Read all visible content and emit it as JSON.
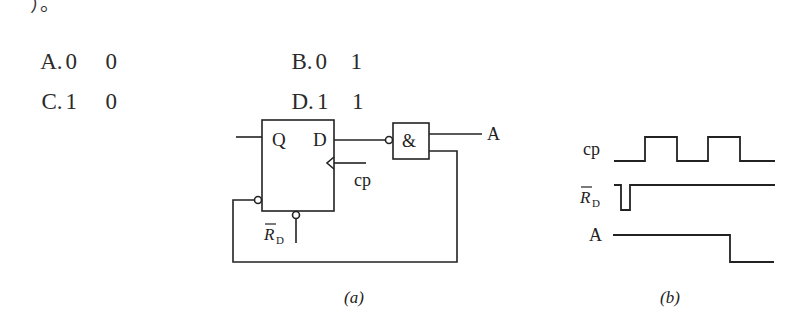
{
  "question_fragment": "）。",
  "options": [
    {
      "letter": "A.",
      "v1": "0",
      "v2": "0"
    },
    {
      "letter": "B.",
      "v1": "0",
      "v2": "1"
    },
    {
      "letter": "C.",
      "v1": "1",
      "v2": "0"
    },
    {
      "letter": "D.",
      "v1": "1",
      "v2": "1"
    }
  ],
  "circuit": {
    "ff_labels": {
      "q": "Q",
      "d": "D",
      "clock": "cp",
      "reset": "R",
      "reset_sub": "D"
    },
    "gate_symbol": "&",
    "output_label": "A",
    "caption": "(a)"
  },
  "waveform": {
    "signals": [
      {
        "name": "cp"
      },
      {
        "name": "R",
        "sub": "D",
        "overbar": true
      },
      {
        "name": "A"
      }
    ],
    "caption": "(b)"
  }
}
